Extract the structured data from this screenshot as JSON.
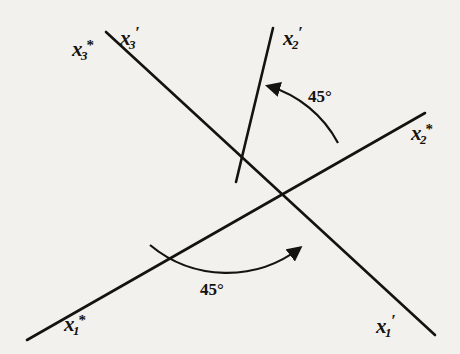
{
  "figure": {
    "background_color": "#f2f1ee",
    "ink_color": "#15130f",
    "origin": {
      "x": 236,
      "y": 182
    }
  },
  "axes": [
    {
      "id": "x3-star",
      "label_base": "x",
      "label_sub": "3",
      "label_mark": "*",
      "mark_kind": "star",
      "label_text": "x3*",
      "position": {
        "x": 72,
        "y": 38
      },
      "endpoint": {
        "x": 106,
        "y": 32
      }
    },
    {
      "id": "x3-prime",
      "label_base": "x",
      "label_sub": "3",
      "label_mark": "′",
      "mark_kind": "prime",
      "label_text": "x3'",
      "position": {
        "x": 120,
        "y": 24
      },
      "endpoint": {
        "x": 106,
        "y": 32
      }
    },
    {
      "id": "x2-prime",
      "label_base": "x",
      "label_sub": "2",
      "label_mark": "′",
      "mark_kind": "prime",
      "label_text": "x2'",
      "position": {
        "x": 283,
        "y": 24
      },
      "endpoint": {
        "x": 273,
        "y": 28
      }
    },
    {
      "id": "x2-star",
      "label_base": "x",
      "label_sub": "2",
      "label_mark": "*",
      "mark_kind": "star",
      "label_text": "x2*",
      "position": {
        "x": 411,
        "y": 122
      },
      "endpoint": {
        "x": 425,
        "y": 113
      }
    },
    {
      "id": "x1-star",
      "label_base": "x",
      "label_sub": "1",
      "label_mark": "*",
      "mark_kind": "star",
      "label_text": "x1*",
      "position": {
        "x": 64,
        "y": 313
      },
      "endpoint": {
        "x": 27,
        "y": 340
      }
    },
    {
      "id": "x1-prime",
      "label_base": "x",
      "label_sub": "1",
      "label_mark": "′",
      "mark_kind": "prime",
      "label_text": "x1'",
      "position": {
        "x": 376,
        "y": 312
      },
      "endpoint": {
        "x": 435,
        "y": 335
      }
    }
  ],
  "lines": [
    {
      "id": "x3-axis-line",
      "from": {
        "x": 106,
        "y": 32
      },
      "to": {
        "x": 435,
        "y": 335
      },
      "label_start": "x3* / x3'",
      "label_end": "x1'"
    },
    {
      "id": "x1-axis-line",
      "from": {
        "x": 27,
        "y": 340
      },
      "to": {
        "x": 425,
        "y": 113
      },
      "label_start": "x1*",
      "label_end": "x2*"
    },
    {
      "id": "x2-prime-line",
      "from": {
        "x": 273,
        "y": 28
      },
      "to": {
        "x": 236,
        "y": 182
      },
      "label_start": "x2'"
    }
  ],
  "angles": [
    {
      "id": "upper-angle",
      "value": "45°",
      "label_position": {
        "x": 308,
        "y": 88
      },
      "from_axis": "x2*",
      "to_axis": "x2'",
      "direction": "counterclockwise",
      "arrow_at": {
        "x": 263,
        "y": 85
      }
    },
    {
      "id": "lower-angle",
      "value": "45°",
      "label_position": {
        "x": 200,
        "y": 281
      },
      "from_axis": "x1*",
      "to_axis": "x1'",
      "direction": "clockwise",
      "arrow_at": {
        "x": 305,
        "y": 248
      }
    }
  ]
}
